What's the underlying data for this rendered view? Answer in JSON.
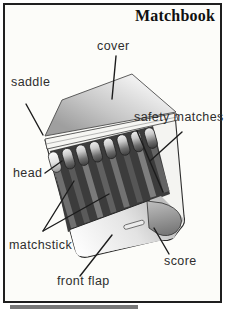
{
  "title": "Matchbook",
  "diagram": {
    "match_count": 8,
    "labels": {
      "cover": "cover",
      "saddle": "saddle",
      "safety_matches": "safety matches",
      "head": "head",
      "matchstick": "matchstick",
      "front_flap": "front flap",
      "score": "score"
    },
    "colors": {
      "frame": "#1f1f1f",
      "background": "#fcfcf9",
      "ink": "#2e2e2e",
      "cover_gray": "#c6c6c6",
      "stick_gray": "#666666",
      "shadow_gray": "#3c3c3c"
    }
  }
}
